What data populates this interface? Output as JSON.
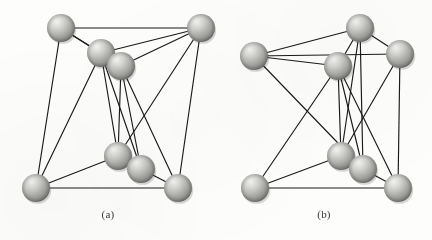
{
  "figure": {
    "type": "ball-and-stick graph diagram",
    "background_color": "#fdfdfc",
    "edge_color": "#1a1a1a",
    "node_fill_light": "#e8e8e6",
    "node_fill_mid": "#b9b9b6",
    "node_fill_dark": "#7d7d7a",
    "node_radius": 14,
    "width": 432,
    "height": 240
  },
  "panels": [
    {
      "id": "a",
      "caption": "(a)",
      "node_count": 8,
      "edge_count": 18,
      "nodes": [
        {
          "id": "a1",
          "name": "top-left",
          "cx": 61,
          "cy": 28,
          "r": 14
        },
        {
          "id": "a2",
          "name": "top-right",
          "cx": 201,
          "cy": 28,
          "r": 14
        },
        {
          "id": "a3",
          "name": "upper-mid",
          "cx": 101,
          "cy": 53,
          "r": 14
        },
        {
          "id": "a4",
          "name": "upper-mid-2",
          "cx": 121,
          "cy": 66,
          "r": 14
        },
        {
          "id": "a5",
          "name": "lower-mid",
          "cx": 118,
          "cy": 156,
          "r": 14
        },
        {
          "id": "a6",
          "name": "lower-mid-2",
          "cx": 141,
          "cy": 169,
          "r": 14
        },
        {
          "id": "a7",
          "name": "bottom-left",
          "cx": 36,
          "cy": 188,
          "r": 14
        },
        {
          "id": "a8",
          "name": "bottom-right",
          "cx": 178,
          "cy": 188,
          "r": 14
        }
      ],
      "edges": [
        [
          "a1",
          "a2"
        ],
        [
          "a1",
          "a3"
        ],
        [
          "a1",
          "a4"
        ],
        [
          "a1",
          "a7"
        ],
        [
          "a3",
          "a2"
        ],
        [
          "a4",
          "a2"
        ],
        [
          "a2",
          "a8"
        ],
        [
          "a2",
          "a5"
        ],
        [
          "a3",
          "a5"
        ],
        [
          "a3",
          "a6"
        ],
        [
          "a4",
          "a5"
        ],
        [
          "a4",
          "a6"
        ],
        [
          "a3",
          "a7"
        ],
        [
          "a4",
          "a8"
        ],
        [
          "a5",
          "a7"
        ],
        [
          "a5",
          "a6"
        ],
        [
          "a6",
          "a8"
        ],
        [
          "a7",
          "a8"
        ]
      ]
    },
    {
      "id": "b",
      "caption": "(b)",
      "node_count": 8,
      "edge_count": 18,
      "nodes": [
        {
          "id": "b1",
          "name": "top-mid",
          "cx": 144,
          "cy": 28,
          "r": 14
        },
        {
          "id": "b2",
          "name": "upper-left",
          "cx": 38,
          "cy": 56,
          "r": 14
        },
        {
          "id": "b3",
          "name": "upper-right",
          "cx": 184,
          "cy": 54,
          "r": 14
        },
        {
          "id": "b4",
          "name": "center-mid",
          "cx": 122,
          "cy": 66,
          "r": 14
        },
        {
          "id": "b5",
          "name": "lower-mid",
          "cx": 125,
          "cy": 156,
          "r": 14
        },
        {
          "id": "b6",
          "name": "lower-mid-2",
          "cx": 147,
          "cy": 169,
          "r": 14
        },
        {
          "id": "b7",
          "name": "bottom-left",
          "cx": 39,
          "cy": 188,
          "r": 14
        },
        {
          "id": "b8",
          "name": "bottom-right",
          "cx": 182,
          "cy": 188,
          "r": 14
        }
      ],
      "edges": [
        [
          "b1",
          "b2"
        ],
        [
          "b1",
          "b3"
        ],
        [
          "b1",
          "b4"
        ],
        [
          "b1",
          "b5"
        ],
        [
          "b1",
          "b6"
        ],
        [
          "b2",
          "b3"
        ],
        [
          "b2",
          "b4"
        ],
        [
          "b2",
          "b6"
        ],
        [
          "b3",
          "b5"
        ],
        [
          "b3",
          "b8"
        ],
        [
          "b4",
          "b5"
        ],
        [
          "b4",
          "b6"
        ],
        [
          "b4",
          "b7"
        ],
        [
          "b4",
          "b8"
        ],
        [
          "b5",
          "b6"
        ],
        [
          "b5",
          "b7"
        ],
        [
          "b6",
          "b8"
        ],
        [
          "b7",
          "b8"
        ]
      ]
    }
  ]
}
